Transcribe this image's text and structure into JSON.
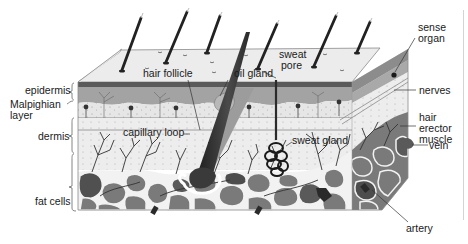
{
  "diagram": {
    "colors": {
      "background": "#ffffff",
      "surface": "#ececec",
      "epidermis_band": "#9a9a9a",
      "epidermis_dark_line": "#555555",
      "dermis": "#e3e3e3",
      "fat_cell": "#7a7a7a",
      "fat_cell_dark": "#4d4d4d",
      "fat_gap": "#f2f2f2",
      "hair": "#2a2a2a",
      "line": "#222222"
    },
    "left_labels": {
      "epidermis": "epidermis",
      "malpighian_line1": "Malpighian",
      "malpighian_line2": "layer",
      "dermis": "dermis",
      "fat_cells": "fat cells"
    },
    "inner_labels": {
      "hair_follicle": "hair follicle",
      "oil_gland": "oil gland",
      "sweat_pore_line1": "sweat",
      "sweat_pore_line2": "pore",
      "capillary_loop": "capillary loop",
      "sweat_gland": "sweat gland"
    },
    "right_labels": {
      "sense_organ_line1": "sense",
      "sense_organ_line2": "organ",
      "nerves": "nerves",
      "hair_erector_line1": "hair",
      "hair_erector_line2": "erector",
      "hair_erector_line3": "muscle",
      "vein": "vein",
      "artery": "artery"
    }
  }
}
